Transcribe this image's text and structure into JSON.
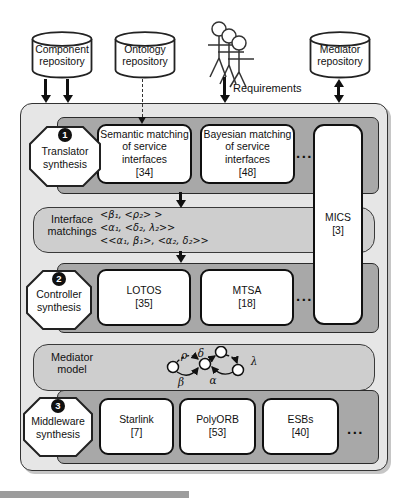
{
  "top": {
    "repositories": [
      {
        "label": "Component\nrepository"
      },
      {
        "label": "Ontology\nrepository"
      },
      {
        "label": "Mediator\nrepository"
      }
    ],
    "requirements_label": "Requirements"
  },
  "pipeline": {
    "stage1": {
      "badge": "1",
      "label": "Translator\nsynthesis",
      "tools": [
        {
          "name": "Semantic matching\nof service\ninterfaces",
          "ref": "[34]"
        },
        {
          "name": "Bayesian matching\nof service\ninterfaces",
          "ref": "[48]"
        }
      ],
      "more": "..."
    },
    "interface_matchings": {
      "label": "Interface\nmatchings",
      "expressions": [
        "<β₁, <ρ₂> >",
        "<α₁, <δ₂, λ₂>>",
        "<<α₁, β₁>, <α₂, δ₂>>"
      ]
    },
    "stage2": {
      "badge": "2",
      "label": "Controller\nsynthesis",
      "tools": [
        {
          "name": "LOTOS",
          "ref": "[35]"
        },
        {
          "name": "MTSA",
          "ref": "[18]"
        }
      ],
      "more": "..."
    },
    "mediator_model": {
      "label": "Mediator\nmodel",
      "transitions": {
        "rho": "ρ",
        "delta": "δ",
        "lambda": "λ",
        "beta": "β",
        "alpha": "α"
      }
    },
    "stage3": {
      "badge": "3",
      "label": "Middleware\nsynthesis",
      "tools": [
        {
          "name": "Starlink",
          "ref": "[7]"
        },
        {
          "name": "PolyORB",
          "ref": "[53]"
        },
        {
          "name": "ESBs",
          "ref": "[40]"
        }
      ],
      "more": "..."
    },
    "mics": {
      "name": "MICS",
      "ref": "[3]"
    }
  },
  "colors": {
    "outer_bg": "#e6e6e6",
    "band_dark": "#a8a8a8",
    "band_light": "#cecece",
    "box_bg": "#ffffff",
    "line": "#111111"
  }
}
